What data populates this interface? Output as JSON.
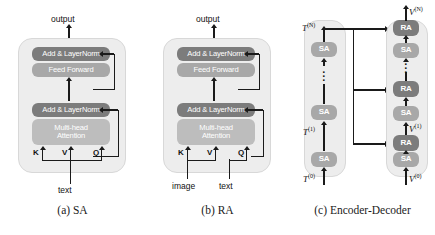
{
  "figure": {
    "caption_a": "(a) SA",
    "caption_b": "(b) RA",
    "caption_c": "(c) Encoder-Decoder",
    "colors": {
      "block_dark": "#7c7c7c",
      "block_mid": "#a8a8a8",
      "block_light": "#bdbdbd",
      "stage_bg": "#ededed",
      "line": "#1a1a1a",
      "page_bg": "#ffffff"
    }
  },
  "panel_a": {
    "name": "SA",
    "output_label": "output",
    "input_label": "text",
    "blocks": [
      {
        "label": "Add & LayerNorm",
        "tone": "dark"
      },
      {
        "label": "Feed Forward",
        "tone": "mid"
      },
      {
        "label": "Add & LayerNorm",
        "tone": "dark"
      },
      {
        "label": "Multi-head Attention",
        "line1": "Multi-head",
        "line2": "Attention",
        "tone": "light"
      }
    ],
    "qkv": [
      "K",
      "V",
      "Q"
    ],
    "qkv_sources": {
      "K": "text",
      "V": "text",
      "Q": "text"
    }
  },
  "panel_b": {
    "name": "RA",
    "output_label": "output",
    "input_labels": [
      "image",
      "text"
    ],
    "blocks": [
      {
        "label": "Add & LayerNorm",
        "tone": "dark"
      },
      {
        "label": "Feed Forward",
        "tone": "mid"
      },
      {
        "label": "Add & LayerNorm",
        "tone": "dark"
      },
      {
        "label": "Multi-head Attention",
        "line1": "Multi-head",
        "line2": "Attention",
        "tone": "light"
      }
    ],
    "qkv": [
      "K",
      "V",
      "Q"
    ],
    "qkv_sources": {
      "K": "image",
      "V": "image",
      "Q": "text"
    }
  },
  "panel_c": {
    "name": "Encoder-Decoder",
    "encoder": {
      "blocks": [
        "SA",
        "SA",
        "SA"
      ],
      "tone": "mid",
      "labels": {
        "input": "T",
        "input_sup": "(0)",
        "mid": "T",
        "mid_sup": "(1)",
        "output": "T",
        "output_sup": "(N)"
      },
      "has_ellipsis": true
    },
    "decoder": {
      "blocks": [
        "SA",
        "RA",
        "SA",
        "RA",
        "SA",
        "RA"
      ],
      "sa_tone": "mid",
      "ra_tone": "dark",
      "labels": {
        "input": "V",
        "input_sup": "(0)",
        "mid": "V",
        "mid_sup": "(1)",
        "output": "V",
        "output_sup": "(N)"
      },
      "has_ellipsis": true
    },
    "cross_connections": 3
  }
}
